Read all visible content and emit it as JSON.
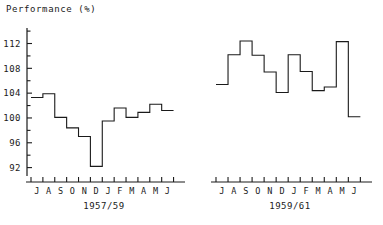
{
  "figure": {
    "axis_title": "Performance (%)",
    "background": "#ffffff",
    "line_color": "#1a1a1a"
  },
  "chart_data": {
    "type": "line",
    "title": "Performance (%)",
    "xlabel": "",
    "ylabel": "Performance (%)",
    "ylim": [
      90,
      114.5
    ],
    "yticks": [
      92,
      96,
      100,
      104,
      108,
      112
    ],
    "ytick_labels": [
      "92",
      "96",
      "100",
      "104",
      "108",
      "112"
    ],
    "minor_yticks": [
      94,
      98,
      102,
      106,
      110,
      114
    ],
    "grid": false,
    "legend": null,
    "drawstyle": "steps-post",
    "panels": [
      {
        "name": "panel-left",
        "caption": "1957/59",
        "categories": [
          "J",
          "A",
          "S",
          "O",
          "N",
          "D",
          "J",
          "F",
          "M",
          "A",
          "M",
          "J"
        ],
        "values": [
          103.3,
          103.9,
          100.1,
          98.4,
          97.0,
          92.2,
          99.5,
          101.6,
          100.1,
          100.9,
          102.2,
          101.2
        ]
      },
      {
        "name": "panel-right",
        "caption": "1959/61",
        "categories": [
          "J",
          "A",
          "S",
          "O",
          "N",
          "D",
          "J",
          "F",
          "M",
          "A",
          "M",
          "J"
        ],
        "values": [
          105.4,
          110.2,
          112.4,
          110.1,
          107.4,
          104.1,
          110.2,
          107.5,
          104.4,
          105.0,
          112.3,
          100.2
        ]
      }
    ]
  }
}
